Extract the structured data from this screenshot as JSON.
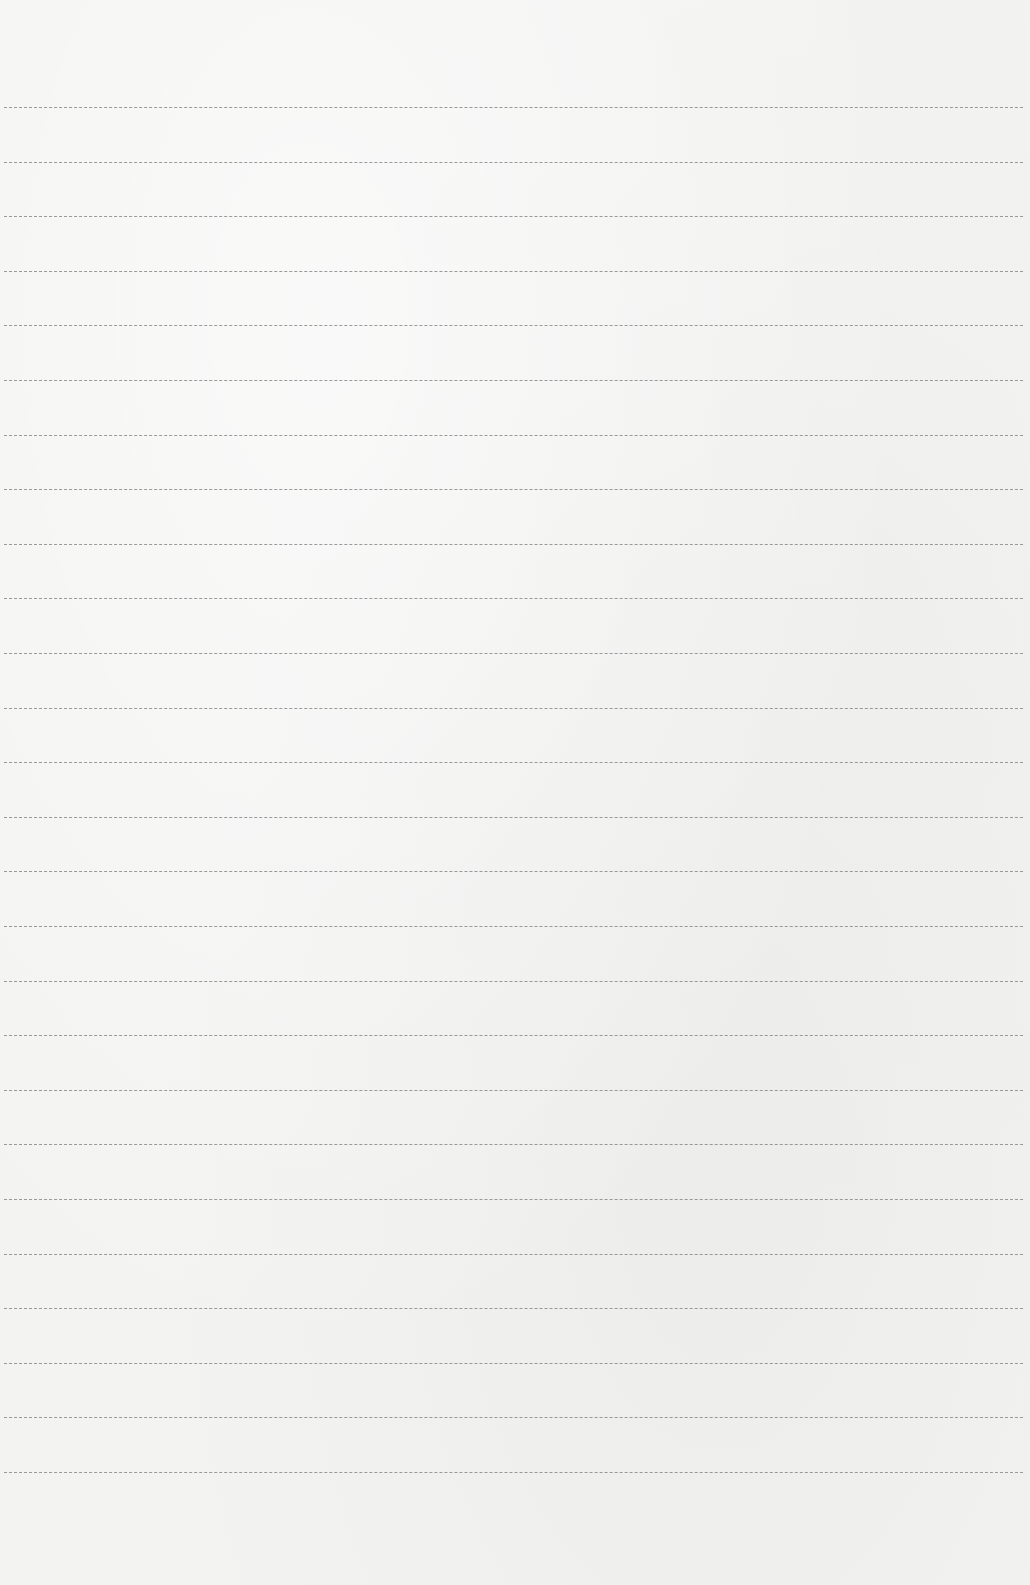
{
  "paper": {
    "background_color": "#f3f3f2",
    "line_color": "#8a8a8a",
    "line_count": 26,
    "first_line_y": 107,
    "line_spacing": 54.6
  }
}
